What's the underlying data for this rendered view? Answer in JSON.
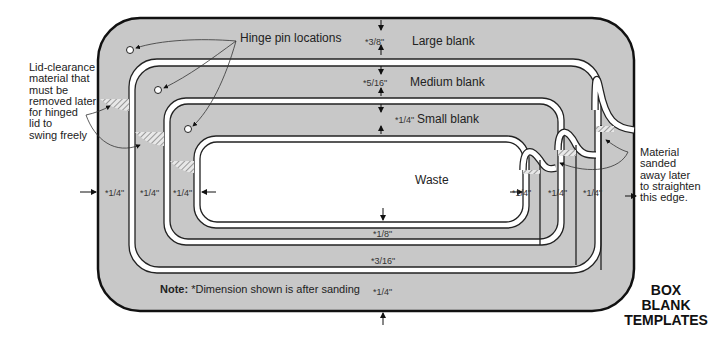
{
  "title": "BOX\nBLANK\nTEMPLATES",
  "labels": {
    "hinge_pin": "Hinge pin locations",
    "large_blank": "Large blank",
    "medium_blank": "Medium blank",
    "small_blank": "Small blank",
    "waste": "Waste",
    "lid_clearance": "Lid-clearance\nmaterial that\nmust be\nremoved later\nfor hinged\nlid to\nswing freely",
    "material_sanded": "Material\nsanded\naway later\nto straighten\nthis edge."
  },
  "note": {
    "prefix": "Note:",
    "text": " *Dimension shown is after sanding"
  },
  "dimensions": {
    "top_large": "*3/8\"",
    "top_medium": "*5/16\"",
    "top_small": "*1/4\"",
    "bottom_small": "*1/8\"",
    "bottom_medium": "*3/16\"",
    "bottom_large": "*1/4\"",
    "left_large": "*1/4\"",
    "left_medium": "*1/4\"",
    "left_small": "*1/4\"",
    "right_small": "*1/4\"",
    "right_medium": "*1/4\"",
    "right_large": "*1/4\""
  },
  "colors": {
    "blank_fill": "#c8c8c8",
    "kerf": "#ffffff",
    "outline": "#111111",
    "hatch": "#888888"
  }
}
